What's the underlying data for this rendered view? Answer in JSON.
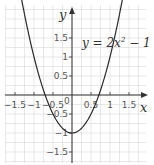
{
  "chart_data": {
    "type": "line",
    "title": "",
    "equation_label": "y = 2x² − 1",
    "equation": {
      "prefix": "y = 2x",
      "exp": "2",
      "suffix": " − 1"
    },
    "xlabel": "x",
    "ylabel": "y",
    "origin_label": "0",
    "xlim": [
      -1.75,
      1.75
    ],
    "ylim": [
      -1.75,
      2.1
    ],
    "grid": true,
    "x_ticks": [
      -1.5,
      -1,
      -0.5,
      0.5,
      1,
      1.5
    ],
    "x_tick_labels": [
      "−1.5",
      "−1",
      "−0.5",
      "0.5",
      "1",
      "1.5"
    ],
    "y_ticks": [
      1.5,
      1,
      0.5,
      -0.5,
      -1,
      -1.5
    ],
    "y_tick_labels": [
      "1.5",
      "1",
      "0.5",
      "−0.5",
      "−1",
      "−1.5"
    ],
    "series": [
      {
        "name": "y = 2x^2 - 1",
        "x": [
          -1.45,
          -1.25,
          -1.0,
          -0.75,
          -0.5,
          -0.25,
          0,
          0.25,
          0.5,
          0.75,
          1.0,
          1.25,
          1.45
        ],
        "values": [
          3.205,
          2.125,
          1.0,
          0.125,
          -0.5,
          -0.875,
          -1.0,
          -0.875,
          -0.5,
          0.125,
          1.0,
          2.125,
          3.205
        ]
      }
    ]
  },
  "colors": {
    "grid": "#d9d9d9",
    "axis": "#333333",
    "curve": "#2a2a2a"
  }
}
